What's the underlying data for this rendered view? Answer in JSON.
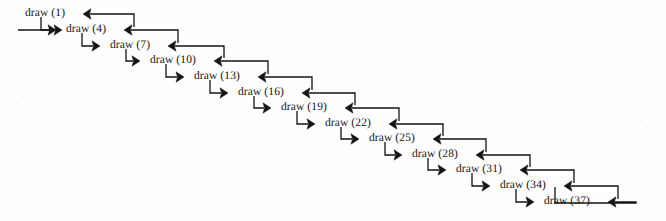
{
  "figure": {
    "kind": "call-return staircase diagram",
    "background_color": "#fefefe",
    "ink_color": "#141414",
    "width": 666,
    "height": 221
  },
  "entry_arrow": {
    "name": "entry-arrow",
    "direction": "right",
    "x1": 18,
    "x2": 62,
    "y": 30
  },
  "exit_loop": {
    "name": "bottom-return-loop",
    "from_x": 636,
    "down_y": 203,
    "left_x": 555,
    "up_y": 187
  },
  "steps": [
    {
      "label": "draw (1)",
      "n": 1,
      "x": 25,
      "y": 14,
      "label_w": 50
    },
    {
      "label": "draw (4)",
      "n": 4,
      "x": 66,
      "y": 30,
      "label_w": 50
    },
    {
      "label": "draw (7)",
      "n": 7,
      "x": 110,
      "y": 46,
      "label_w": 50
    },
    {
      "label": "draw (10)",
      "n": 10,
      "x": 150,
      "y": 61,
      "label_w": 56
    },
    {
      "label": "draw (13)",
      "n": 13,
      "x": 194,
      "y": 77,
      "label_w": 56
    },
    {
      "label": "draw (16)",
      "n": 16,
      "x": 238,
      "y": 93,
      "label_w": 56
    },
    {
      "label": "draw (19)",
      "n": 19,
      "x": 281,
      "y": 108,
      "label_w": 56
    },
    {
      "label": "draw (22)",
      "n": 22,
      "x": 325,
      "y": 124,
      "label_w": 56
    },
    {
      "label": "draw (25)",
      "n": 25,
      "x": 369,
      "y": 139,
      "label_w": 56
    },
    {
      "label": "draw (28)",
      "n": 28,
      "x": 412,
      "y": 155,
      "label_w": 56
    },
    {
      "label": "draw (31)",
      "n": 31,
      "x": 456,
      "y": 170,
      "label_w": 56
    },
    {
      "label": "draw (34)",
      "n": 34,
      "x": 500,
      "y": 186,
      "label_w": 56
    },
    {
      "label": "draw (37)",
      "n": 37,
      "x": 544,
      "y": 202,
      "label_w": 56
    }
  ],
  "geometry": {
    "forward_arrow_gap": 10,
    "return_arrow_gap": 8,
    "forward_stub": 16,
    "return_stub": 18,
    "stroke_width": 1.3,
    "arrow_head_len": 8,
    "arrow_head_w": 5.2
  }
}
